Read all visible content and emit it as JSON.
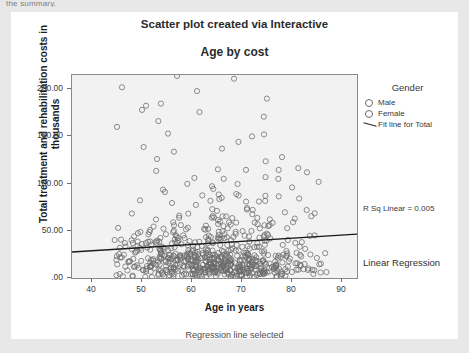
{
  "page": {
    "clipped_text_above": "the summary.",
    "background_color": "#e8e8e8",
    "card_color": "#ffffff"
  },
  "titles": {
    "main": "Scatter plot created via Interactive",
    "sub": "Age by cost"
  },
  "legend": {
    "title": "Gender",
    "items": [
      {
        "label": "Male",
        "symbol": "circle-outline-icon"
      },
      {
        "label": "Female",
        "symbol": "circle-outline-icon"
      },
      {
        "label": "Fit line for Total",
        "symbol": "line-segment-icon"
      }
    ]
  },
  "annotations": {
    "r_squared": "R Sq Linear = 0.005",
    "model": "Linear Regression"
  },
  "caption": "Regression line selected",
  "chart_data": {
    "type": "scatter",
    "title": "Age by cost",
    "supertitle": "Scatter plot created via Interactive",
    "xlabel": "Age in years",
    "ylabel": "Total treatment and rehabilitation costs in thousands",
    "xlim": [
      36,
      93
    ],
    "ylim": [
      0,
      215
    ],
    "xticks": [
      40,
      50,
      60,
      70,
      80,
      90
    ],
    "xticklabels": [
      "40",
      "50",
      "60",
      "70",
      "80",
      "90"
    ],
    "yticks": [
      0,
      50,
      100,
      150,
      200
    ],
    "yticklabels": [
      ".00",
      "50.00",
      "100.00",
      "150.00",
      "200.00"
    ],
    "grid": false,
    "legend_position": "right",
    "marker": "open-circle",
    "marker_color": "#6b6b6b",
    "plot_background": "#f2f2f2",
    "series": [
      {
        "name": "Male",
        "marker": "open-circle",
        "n_points": 330
      },
      {
        "name": "Female",
        "marker": "open-circle",
        "n_points": 330
      }
    ],
    "fit_line": {
      "name": "Fit line for Total",
      "r_squared": 0.005,
      "x_start": 36,
      "x_end": 93,
      "y_start": 27.5,
      "y_end": 46.5,
      "color": "#1a1a1a"
    },
    "density_note": "Points concentrated below 60 thousand between ages 45 and 85, thinning sharply above 100 thousand; a few outliers near 200 thousand."
  }
}
